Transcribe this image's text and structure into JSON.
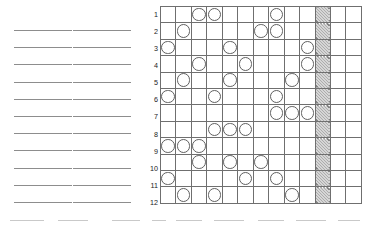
{
  "worksheet": {
    "answer_lines": {
      "columns": 2,
      "lines_per_column": 11,
      "line_values": [
        "",
        "",
        "",
        "",
        "",
        "",
        "",
        "",
        "",
        "",
        ""
      ]
    }
  },
  "grid": {
    "columns": 13,
    "rows": 12,
    "row_labels": [
      "1",
      "2",
      "3",
      "4",
      "5",
      "6",
      "7",
      "8",
      "9",
      "10",
      "11",
      "12"
    ],
    "hatched_column": 11,
    "cell_marker": "circle",
    "circle_columns_by_row": {
      "1": [
        3,
        4,
        8
      ],
      "2": [
        2,
        7,
        8
      ],
      "3": [
        1,
        5,
        10
      ],
      "4": [
        3,
        6,
        10
      ],
      "5": [
        2,
        5,
        9
      ],
      "6": [
        1,
        4,
        8
      ],
      "7": [
        8,
        9,
        10
      ],
      "8": [
        4,
        5,
        6
      ],
      "9": [
        1,
        2,
        3
      ],
      "10": [
        3,
        5,
        7
      ],
      "11": [
        1,
        6,
        8
      ],
      "12": [
        2,
        4,
        9
      ]
    },
    "colors": {
      "grid_line": "#6f6f6f",
      "circle_stroke": "#5f5f5f",
      "hatch_stroke": "#5a5a5a",
      "label_text": "#1a1a1a",
      "blank_line": "#8d8d8d",
      "background": "#ffffff"
    }
  },
  "bottom_strip": {
    "dash_count": 9
  }
}
